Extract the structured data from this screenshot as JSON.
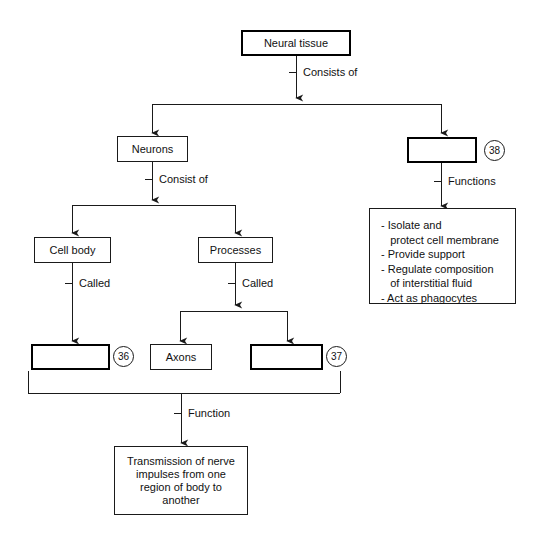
{
  "diagram": {
    "title_node": {
      "label": "Neural tissue"
    },
    "nodes": {
      "neural_tissue": "Neural tissue",
      "neurons": "Neurons",
      "neuroglia_blank": "",
      "cell_body": "Cell body",
      "processes": "Processes",
      "blank_36": "",
      "axons": "Axons",
      "blank_37": "",
      "transmission": "Transmission of nerve\nimpulses from one\nregion of body to\nanother"
    },
    "functions_box": {
      "lines": [
        "- Isolate and",
        "   protect cell membrane",
        "- Provide support",
        "- Regulate composition",
        "   of interstitial fluid",
        "- Act as phagocytes"
      ]
    },
    "edge_labels": {
      "consists_of": "Consists of",
      "consist_of": "Consist of",
      "functions": "Functions",
      "called_left": "Called",
      "called_right": "Called",
      "function": "Function"
    },
    "answer_numbers": {
      "n36": "36",
      "n37": "37",
      "n38": "38"
    },
    "colors": {
      "line": "#1a1a1a",
      "text": "#111111",
      "background": "#ffffff"
    }
  }
}
